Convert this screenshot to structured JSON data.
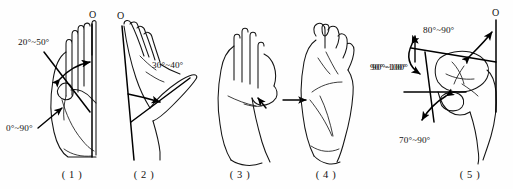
{
  "figure": {
    "panel_count": 5,
    "line_color": "#141414",
    "background_color": "#ffffff"
  },
  "panels": [
    {
      "id": "panel-1",
      "caption": "( 1 )",
      "view": "palmar view of left hand, thumb abduction in plane of palm",
      "origin_marker": "O",
      "labels": [
        {
          "name": "thumb-radial-abduction",
          "text": "20°~50°"
        },
        {
          "name": "thumb-palmar-abduction",
          "text": "0°~90°"
        }
      ]
    },
    {
      "id": "panel-2",
      "caption": "( 2 )",
      "view": "radial view of hand, thumb palmar abduction",
      "origin_marker": "O",
      "labels": [
        {
          "name": "thumb-abduction-angle",
          "text": "30°~40°"
        }
      ]
    },
    {
      "id": "panel-3",
      "caption": "( 3 )",
      "view": "dorsal view of relaxed open hand, start of opposition",
      "origin_marker": "",
      "labels": []
    },
    {
      "id": "panel-4",
      "caption": "( 4 )",
      "view": "hand with fingers flexed, thumb opposition end position",
      "origin_marker": "",
      "labels": [
        {
          "name": "thumb-opposition-angle",
          "text": "90°~100°"
        }
      ]
    },
    {
      "id": "panel-5",
      "caption": "( 5 )",
      "view": "detail of thumb joints with goniometric reference lines",
      "origin_marker": "O",
      "labels": [
        {
          "name": "thumb-mp-angle",
          "text": "80°~90°"
        },
        {
          "name": "thumb-cmc-angle",
          "text": "90°~100°"
        },
        {
          "name": "thumb-ip-angle",
          "text": "70°~90°"
        }
      ]
    }
  ],
  "captions": {
    "p1": "( 1 )",
    "p2": "( 2 )",
    "p3": "( 3 )",
    "p4": "( 4 )",
    "p5": "( 5 )"
  },
  "origins": {
    "o1": "O",
    "o2": "O",
    "o5": "O"
  },
  "angles": {
    "a1_upper": "20°~50°",
    "a1_lower": "0°~90°",
    "a2": "30°~40°",
    "a4": "90°~100°",
    "a5_top": "80°~90°",
    "a5_left": "90°~100°",
    "a5_bottom": "70°~90°"
  }
}
